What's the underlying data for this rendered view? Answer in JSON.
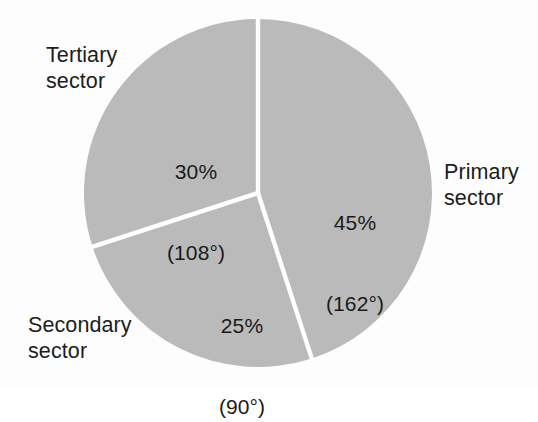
{
  "chart_data": {
    "type": "pie",
    "title": "",
    "subtitle": "",
    "xlabel": "",
    "ylabel": "",
    "legend_position": "none",
    "grid": false,
    "units": "percent",
    "start_angle_deg": 0,
    "direction": "clockwise",
    "categories": [
      "Primary sector",
      "Secondary sector",
      "Tertiary sector"
    ],
    "values": [
      45,
      25,
      30
    ],
    "angles_deg": [
      162,
      90,
      108
    ],
    "slices": [
      {
        "name": "primary",
        "label": "Primary",
        "label_line2": "sector",
        "value": 45,
        "percent_text": "45%",
        "angle_deg": 162,
        "angle_text": "(162°)",
        "start_deg": 0,
        "end_deg": 162,
        "color": "#bababa"
      },
      {
        "name": "secondary",
        "label": "Secondary",
        "label_line2": "sector",
        "value": 25,
        "percent_text": "25%",
        "angle_deg": 90,
        "angle_text": "(90°)",
        "start_deg": 162,
        "end_deg": 252,
        "color": "#bababa"
      },
      {
        "name": "tertiary",
        "label": "Tertiary",
        "label_line2": "sector",
        "value": 30,
        "percent_text": "30%",
        "angle_deg": 108,
        "angle_text": "(108°)",
        "start_deg": 252,
        "end_deg": 360,
        "color": "#bababa"
      }
    ],
    "colors": {
      "slice_fill": "#bababa",
      "separator": "#ffffff",
      "text": "#1a1a1a",
      "background": "#fdfdfd"
    }
  },
  "labels": {
    "tertiary_line1": "Tertiary",
    "tertiary_line2": "sector",
    "primary_line1": "Primary",
    "primary_line2": "sector",
    "secondary_line1": "Secondary",
    "secondary_line2": "sector"
  },
  "values": {
    "primary_percent": "45%",
    "primary_angle": "(162°)",
    "secondary_percent": "25%",
    "secondary_angle": "(90°)",
    "tertiary_percent": "30%",
    "tertiary_angle": "(108°)"
  }
}
